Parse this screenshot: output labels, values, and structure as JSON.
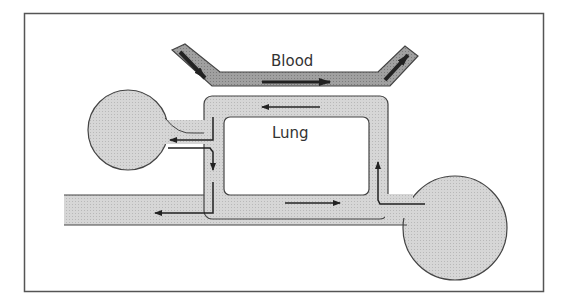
{
  "diagram": {
    "labels": {
      "blood": "Blood",
      "lung": "Lung"
    },
    "elements": [
      {
        "name": "blood-vessel",
        "description": "Dark gray angled channel at top with flow arrows left-to-right"
      },
      {
        "name": "lung-loop",
        "description": "Light gray rectangular loop channel surrounding the Lung chamber"
      },
      {
        "name": "left-reservoir",
        "description": "Circular chamber on left connected to loop"
      },
      {
        "name": "right-reservoir",
        "description": "Circular chamber on right connected to loop"
      },
      {
        "name": "inlet-pipe",
        "description": "Horizontal pipe entering from left edge along bottom"
      }
    ],
    "colors": {
      "frame": "#555555",
      "blood_fill": "#9a9a9a",
      "channel_fill": "#d4d4d4",
      "stroke": "#444444",
      "arrow": "#222222"
    }
  }
}
